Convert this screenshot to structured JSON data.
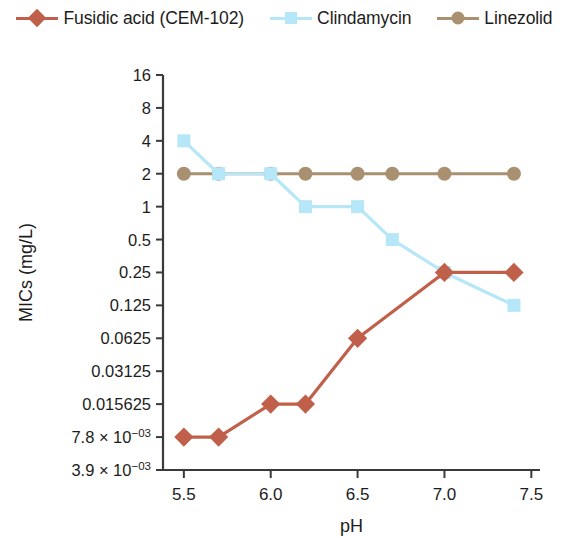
{
  "chart_data": {
    "type": "line",
    "title": "",
    "xlabel": "pH",
    "ylabel": "MICs (mg/L)",
    "x": [
      5.5,
      5.7,
      6.0,
      6.2,
      6.5,
      6.7,
      7.0,
      7.4
    ],
    "xtick_labels": [
      "5.5",
      "6.0",
      "6.5",
      "7.0",
      "7.5"
    ],
    "xtick_values": [
      5.5,
      6.0,
      6.5,
      7.0,
      7.5
    ],
    "xlim": [
      5.38,
      7.55
    ],
    "yscale": "log2",
    "ylim": [
      0.0039,
      16
    ],
    "ytick_values": [
      16,
      8,
      4,
      2,
      1,
      0.5,
      0.25,
      0.125,
      0.0625,
      0.03125,
      0.015625,
      0.0078,
      0.0039
    ],
    "ytick_labels": [
      "16",
      "8",
      "4",
      "2",
      "1",
      "0.5",
      "0.25",
      "0.125",
      "0.0625",
      "0.03125",
      "0.015625",
      "7.8 × 10⁻⁰³",
      "3.9 × 10⁻⁰³"
    ],
    "grid": false,
    "legend_position": "top",
    "series": [
      {
        "name": "Fusidic acid (CEM-102)",
        "color": "#c0604a",
        "marker": "diamond",
        "x": [
          5.5,
          5.7,
          6.0,
          6.2,
          6.5,
          7.0,
          7.4
        ],
        "values": [
          0.0078,
          0.0078,
          0.015625,
          0.015625,
          0.0625,
          0.25,
          0.25
        ]
      },
      {
        "name": "Clindamycin",
        "color": "#b6e7f8",
        "marker": "square",
        "x": [
          5.5,
          5.7,
          6.0,
          6.2,
          6.5,
          6.7,
          7.0,
          7.4
        ],
        "values": [
          4,
          2,
          2,
          1,
          1,
          0.5,
          0.25,
          0.125
        ]
      },
      {
        "name": "Linezolid",
        "color": "#a89070",
        "marker": "circle",
        "x": [
          5.5,
          5.7,
          6.0,
          6.2,
          6.5,
          6.7,
          7.0,
          7.4
        ],
        "values": [
          2,
          2,
          2,
          2,
          2,
          2,
          2,
          2
        ]
      }
    ]
  },
  "legend": {
    "items": [
      {
        "label": "Fusidic acid (CEM-102)",
        "color": "#c0604a",
        "marker": "diamond"
      },
      {
        "label": "Clindamycin",
        "color": "#b6e7f8",
        "marker": "square"
      },
      {
        "label": "Linezolid",
        "color": "#a89070",
        "marker": "circle"
      }
    ]
  },
  "axes": {
    "x_title": "pH",
    "y_title": "MICs (mg/L)"
  }
}
